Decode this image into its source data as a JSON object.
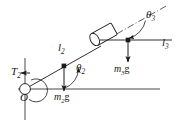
{
  "figure": {
    "kind": "free-body-diagram",
    "width": 180,
    "height": 135,
    "background_color": "#ffffff",
    "line_color": "#1a1a1a",
    "labels": {
      "torque": {
        "symbol": "T",
        "subscript": "2"
      },
      "origin": {
        "symbol": "O"
      },
      "link2_length": {
        "symbol": "l",
        "subscript": "2"
      },
      "link3_length": {
        "symbol": "l",
        "subscript": "3"
      },
      "angle2": {
        "symbol": "θ",
        "subscript": "2"
      },
      "angle3": {
        "symbol": "θ",
        "subscript": "3"
      },
      "weight2": {
        "mass": "m",
        "subscript": "2",
        "gravity": "g"
      },
      "weight3": {
        "mass": "m",
        "subscript": "3",
        "gravity": "g"
      }
    },
    "geometry": {
      "origin_point": [
        25,
        89
      ],
      "link2_midpoint": [
        64,
        67
      ],
      "block_center": [
        105,
        33
      ],
      "link3_point": [
        128,
        40
      ],
      "horizontal_axis": [
        18,
        160
      ],
      "vertical_axis": [
        58,
        120
      ],
      "axis_y": 89
    }
  }
}
